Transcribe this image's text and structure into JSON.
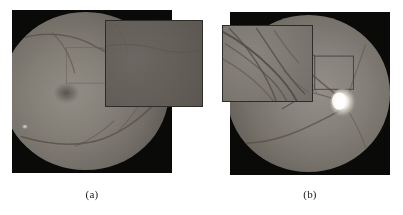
{
  "figure": {
    "type": "two-panel-image-figure",
    "background_color": "#ffffff",
    "panel_count": 2
  },
  "panels": [
    {
      "id": "panel-a",
      "caption": "(a)",
      "image_kind": "retinal-fundus-photograph",
      "frame_color": "#0a0a09",
      "retina_color": "#827d75",
      "bounds": {
        "x": 12,
        "y": 10,
        "width": 160,
        "height": 163
      },
      "features": {
        "macula_visible": true,
        "optic_disc_visible": false,
        "vessel_arcades": "superior and inferior arcades crossing the disc",
        "bright_artifact_spot": true
      },
      "inset": {
        "id": "inset-a",
        "label": "magnified-region-of-interest",
        "bounds": {
          "x": 105,
          "y": 20,
          "width": 98,
          "height": 87
        },
        "border_color": "#2e2b28",
        "fill_color": "#645f58",
        "contrast": "low",
        "content": "dark low-contrast retina patch with faint thin vessels"
      },
      "roi_box": {
        "visible": true,
        "style": "faint-thin-outline",
        "bounds": {
          "x": 73,
          "y": 45,
          "width": 36,
          "height": 33
        }
      }
    },
    {
      "id": "panel-b",
      "caption": "(b)",
      "image_kind": "retinal-fundus-photograph",
      "frame_color": "#0a0a09",
      "retina_color": "#85807a",
      "bounds": {
        "x": 230,
        "y": 12,
        "width": 160,
        "height": 163
      },
      "features": {
        "macula_visible": false,
        "optic_disc_visible": true,
        "optic_disc_color": "#f2efe6",
        "optic_disc_center": {
          "x": 344,
          "y": 96
        },
        "vessel_arcades": "vessels radiating from the optic disc",
        "bright_artifact_spot": false
      },
      "inset": {
        "id": "inset-b",
        "label": "magnified-region-of-interest",
        "bounds": {
          "x": 222,
          "y": 25,
          "width": 91,
          "height": 77
        },
        "border_color": "#2e2b28",
        "fill_color": "#7f7a73",
        "contrast": "high",
        "content": "bright enhanced retina patch with clearly visible branching vessels"
      },
      "roi_box": {
        "visible": true,
        "style": "thin-outline-with-connector-lines",
        "bounds": {
          "x": 313,
          "y": 52,
          "width": 37,
          "height": 33
        }
      }
    }
  ],
  "captions": {
    "a": "(a)",
    "b": "(b)"
  }
}
